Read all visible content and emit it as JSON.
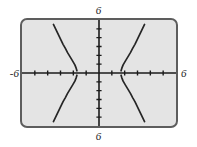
{
  "figure": {
    "kind": "graphing-calculator-screen",
    "caption": ""
  },
  "window_labels": {
    "top": "6",
    "bottom": "6",
    "left": "-6",
    "right": "6"
  },
  "colors": {
    "screen_background": "#e4e4e4",
    "screen_border": "#5d5d5d",
    "screen_shadow": "#c9c9c9",
    "axis": "#1b1b1b",
    "curve": "#262626",
    "label_text": "#1b1b1b",
    "page_background": "#ffffff"
  },
  "chart_data": {
    "type": "line",
    "title": "",
    "xlabel": "",
    "ylabel": "",
    "xlim": [
      -6,
      6
    ],
    "ylim": [
      -6,
      6
    ],
    "grid": false,
    "legend": "none",
    "axes": {
      "x_axis_visible": true,
      "y_axis_visible": true,
      "x_tick_interval": 1,
      "y_tick_interval": 1,
      "x_ticks": [
        -5,
        -4,
        -3,
        -2,
        -1,
        1,
        2,
        3,
        4,
        5
      ],
      "y_ticks": [
        -5,
        -4,
        -3,
        -2,
        -1,
        1,
        2,
        3,
        4,
        5
      ],
      "tick_style": "short-marks-on-axis"
    },
    "series": [
      {
        "name": "branch-quadrant-II",
        "quadrant": "upper-left",
        "points": [
          [
            -3.55,
            5.5
          ],
          [
            -3.4,
            5.05
          ],
          [
            -3.25,
            4.6
          ],
          [
            -3.1,
            4.15
          ],
          [
            -2.95,
            3.7
          ],
          [
            -2.8,
            3.25
          ],
          [
            -2.62,
            2.78
          ],
          [
            -2.45,
            2.3
          ],
          [
            -2.25,
            1.82
          ],
          [
            -2.05,
            1.35
          ],
          [
            -1.88,
            0.92
          ],
          [
            -1.78,
            0.55
          ],
          [
            -1.72,
            0.25
          ]
        ]
      },
      {
        "name": "branch-quadrant-I",
        "quadrant": "upper-right",
        "points": [
          [
            1.72,
            0.25
          ],
          [
            1.78,
            0.55
          ],
          [
            1.88,
            0.92
          ],
          [
            2.05,
            1.35
          ],
          [
            2.25,
            1.82
          ],
          [
            2.45,
            2.3
          ],
          [
            2.62,
            2.78
          ],
          [
            2.8,
            3.25
          ],
          [
            2.95,
            3.7
          ],
          [
            3.1,
            4.15
          ],
          [
            3.25,
            4.6
          ],
          [
            3.4,
            5.05
          ],
          [
            3.55,
            5.5
          ]
        ]
      },
      {
        "name": "branch-quadrant-III",
        "quadrant": "lower-left",
        "points": [
          [
            -3.55,
            -5.5
          ],
          [
            -3.4,
            -5.05
          ],
          [
            -3.25,
            -4.6
          ],
          [
            -3.1,
            -4.15
          ],
          [
            -2.95,
            -3.7
          ],
          [
            -2.8,
            -3.25
          ],
          [
            -2.62,
            -2.78
          ],
          [
            -2.45,
            -2.3
          ],
          [
            -2.25,
            -1.82
          ],
          [
            -2.05,
            -1.35
          ],
          [
            -1.88,
            -0.92
          ],
          [
            -1.78,
            -0.55
          ],
          [
            -1.72,
            -0.25
          ]
        ]
      },
      {
        "name": "branch-quadrant-IV",
        "quadrant": "lower-right",
        "points": [
          [
            1.72,
            -0.25
          ],
          [
            1.78,
            -0.55
          ],
          [
            1.88,
            -0.92
          ],
          [
            2.05,
            -1.35
          ],
          [
            2.25,
            -1.82
          ],
          [
            2.45,
            -2.3
          ],
          [
            2.62,
            -2.78
          ],
          [
            2.8,
            -3.25
          ],
          [
            2.95,
            -3.7
          ],
          [
            3.1,
            -4.15
          ],
          [
            3.25,
            -4.6
          ],
          [
            3.4,
            -5.05
          ],
          [
            3.55,
            -5.5
          ]
        ]
      }
    ]
  }
}
